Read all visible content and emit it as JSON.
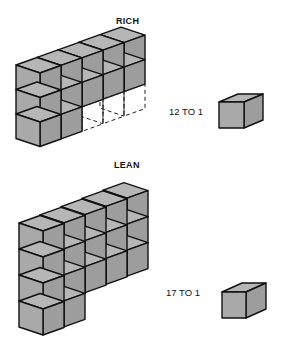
{
  "figure": {
    "type": "cube-ratio-diagram",
    "colors": {
      "front_face": "#a9a9a9",
      "side_face": "#9d9d9d",
      "top_face": "#b6b6b6",
      "outline": "#111111",
      "background": "#ffffff"
    },
    "panels": [
      {
        "id": "rich",
        "title": "RICH",
        "ratio_label": "12 TO 1",
        "block": {
          "length": 5,
          "height": 3,
          "missing_bottom_columns": [
            2,
            3,
            4
          ],
          "cube_count": 12,
          "missing_shown_dashed": true
        },
        "single_cube_count": 1
      },
      {
        "id": "lean",
        "title": "LEAN",
        "ratio_label": "17 TO 1",
        "block": {
          "length": 5,
          "height": 4,
          "missing_bottom_columns": [
            2,
            3,
            4
          ],
          "cube_count": 17,
          "missing_shown_dashed": false
        },
        "single_cube_count": 1
      }
    ]
  }
}
